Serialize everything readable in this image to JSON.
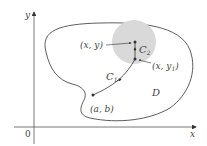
{
  "diagram": {
    "axes": {
      "x_label": "x",
      "y_label": "y",
      "origin_label": "0"
    },
    "region": {
      "label": "D",
      "fill": "#ffffff",
      "stroke": "#333333"
    },
    "disk": {
      "fill": "#d9d9d9"
    },
    "points": {
      "xy": {
        "label": "(x, y)"
      },
      "xy1": {
        "label_main": "(x, y",
        "label_sub": "1",
        "label_end": ")"
      },
      "ab": {
        "label": "(a, b)"
      }
    },
    "curves": {
      "c1": {
        "label_main": "C",
        "label_sub": "1"
      },
      "c2": {
        "label_main": "C",
        "label_sub": "2"
      }
    }
  }
}
